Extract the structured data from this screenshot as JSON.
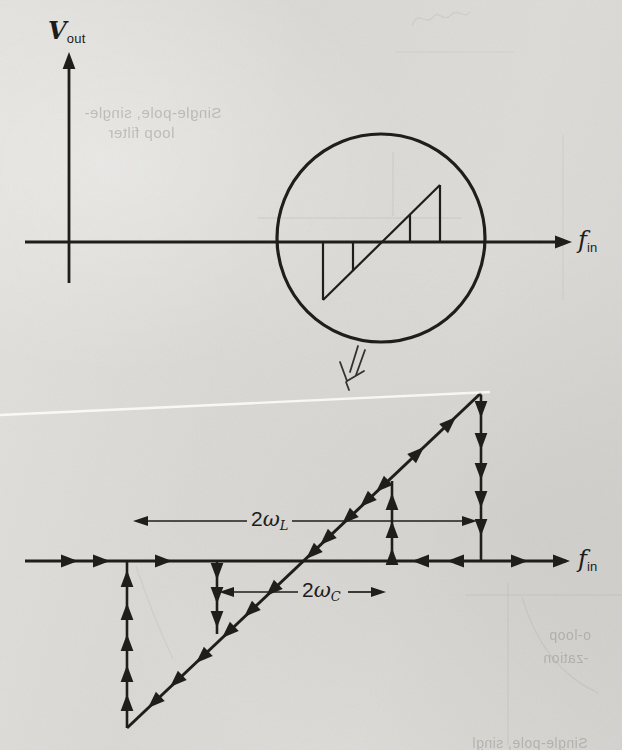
{
  "colors": {
    "ink": "#1f1e1b",
    "paper": "#dcdbd7",
    "ghost": "#b2b1ab"
  },
  "upper_graph": {
    "y_label": {
      "base": "V",
      "sub": "out"
    },
    "x_label": {
      "base": "f",
      "sub": "in"
    }
  },
  "lower_graph": {
    "x_label": {
      "base": "f",
      "sub": "in"
    },
    "lock_range_label": {
      "prefix": "2",
      "base": "ω",
      "sub": "L"
    },
    "capture_range_label": {
      "prefix": "2",
      "base": "ω",
      "sub": "C"
    }
  },
  "ghost_showthrough": {
    "top_left_line1": "Single-pole, single-",
    "top_left_line2": "loop filter",
    "bottom_right_line1": "o-loop",
    "bottom_right_line2": "-zation",
    "bottom_edge": "Single-pole, singl"
  }
}
